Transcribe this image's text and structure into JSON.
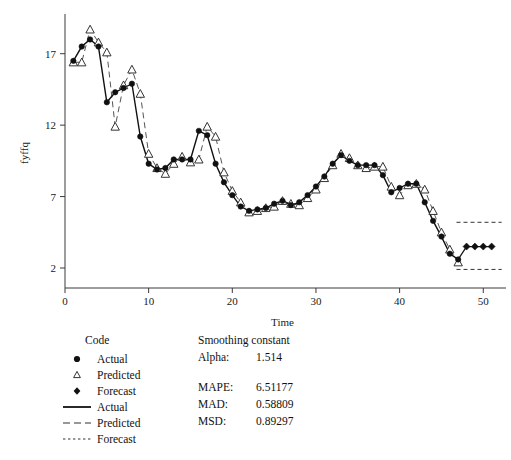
{
  "chart_data": {
    "type": "line",
    "title": "",
    "xlabel": "Time",
    "ylabel": "fyffq",
    "xlim": [
      0,
      52
    ],
    "ylim": [
      0.6,
      19.5
    ],
    "xticks": [
      0,
      10,
      20,
      30,
      40,
      50
    ],
    "yticks": [
      2,
      7,
      12,
      17
    ],
    "grid": false,
    "legend_position": "below-plot-left",
    "x": [
      1,
      2,
      3,
      4,
      5,
      6,
      7,
      8,
      9,
      10,
      11,
      12,
      13,
      14,
      15,
      16,
      17,
      18,
      19,
      20,
      21,
      22,
      23,
      24,
      25,
      26,
      27,
      28,
      29,
      30,
      31,
      32,
      33,
      34,
      35,
      36,
      37,
      38,
      39,
      40,
      41,
      42,
      43,
      44,
      45,
      46,
      47
    ],
    "series": [
      {
        "name": "Actual",
        "marker": "filled-circle",
        "line": "solid",
        "values": [
          16.5,
          17.5,
          18.0,
          17.5,
          13.6,
          14.3,
          14.6,
          14.9,
          11.2,
          9.3,
          8.9,
          9.0,
          9.6,
          9.6,
          9.6,
          11.6,
          11.3,
          9.3,
          8.0,
          7.1,
          6.3,
          6.0,
          6.1,
          6.2,
          6.5,
          6.7,
          6.4,
          6.6,
          7.1,
          7.7,
          8.4,
          9.3,
          9.9,
          9.5,
          9.2,
          9.2,
          9.2,
          8.5,
          7.3,
          7.6,
          7.9,
          7.9,
          6.6,
          5.3,
          4.2,
          3.0,
          2.6
        ]
      },
      {
        "name": "Predicted",
        "marker": "open-triangle",
        "line": "dashed",
        "values": [
          16.4,
          16.4,
          18.7,
          17.8,
          17.1,
          11.9,
          14.8,
          15.9,
          14.2,
          10.0,
          9.0,
          8.6,
          9.3,
          9.8,
          9.4,
          9.6,
          11.9,
          11.2,
          8.7,
          7.4,
          6.6,
          5.9,
          6.0,
          6.2,
          6.3,
          6.7,
          6.5,
          6.4,
          6.9,
          7.5,
          8.3,
          9.2,
          10.0,
          9.7,
          9.2,
          9.0,
          9.1,
          9.1,
          7.7,
          7.1,
          7.8,
          7.9,
          7.5,
          6.0,
          4.5,
          3.3,
          2.4
        ]
      }
    ],
    "forecast": {
      "name": "Forecast",
      "marker": "filled-diamond",
      "line": "solid",
      "x": [
        48,
        49,
        50,
        51
      ],
      "values": [
        3.5,
        3.5,
        3.5,
        3.5
      ],
      "bounds": {
        "upper_line_style": "dotted",
        "lower_line_style": "dotted",
        "upper": 5.2,
        "lower": 1.9
      }
    }
  },
  "legend": {
    "code_header": "Code",
    "marker_entries": [
      {
        "symbol": "filled-circle",
        "label": "Actual"
      },
      {
        "symbol": "open-triangle",
        "label": "Predicted"
      },
      {
        "symbol": "filled-diamond",
        "label": "Forecast"
      }
    ],
    "line_entries": [
      {
        "symbol": "solid-line",
        "label": "Actual"
      },
      {
        "symbol": "dashed-line",
        "label": "Predicted"
      },
      {
        "symbol": "dotted-line",
        "label": "Forecast"
      }
    ]
  },
  "stats": {
    "header": "Smoothing constant",
    "alpha_label": "Alpha:",
    "alpha_value": "1.514",
    "rows": [
      {
        "label": "MAPE:",
        "value": "6.51177"
      },
      {
        "label": "MAD:",
        "value": "0.58809"
      },
      {
        "label": "MSD:",
        "value": "0.89297"
      }
    ]
  },
  "colors": {
    "actual": "#111111",
    "predicted": "#555555",
    "forecast": "#111111",
    "axis": "#3a3a3a",
    "background": "#ffffff"
  }
}
